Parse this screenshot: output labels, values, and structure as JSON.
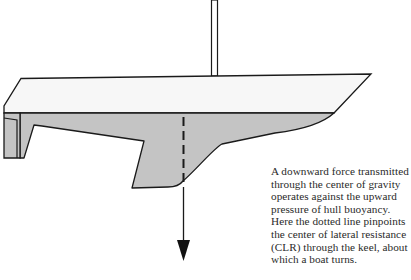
{
  "figure": {
    "colors": {
      "outline": "#1a1a1a",
      "hull_topside": "#f7f7f7",
      "underbody": "#c4c4c4",
      "background": "#ffffff"
    },
    "elements": {
      "mast": "mast",
      "topside": "hull topside above waterline",
      "underbody": "hull underbody with keel and rudder",
      "clr_line": "dashed line through center of lateral resistance",
      "force_arrow": "downward force arrow through center of gravity"
    }
  },
  "caption": {
    "lines": [
      "A downward force transmitted",
      "through the center of gravity",
      "operates against the upward",
      "pressure of hull buoyancy.",
      "Here the dotted line pinpoints",
      "the center of lateral resistance",
      "(CLR) through the keel, about",
      "which a boat turns."
    ]
  }
}
